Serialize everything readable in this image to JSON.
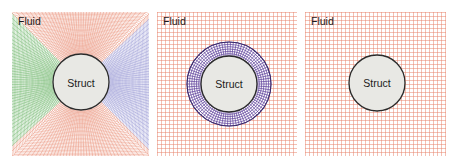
{
  "figure": {
    "panels": [
      {
        "id": "conforming-mesh",
        "region_label": "Fluid",
        "solid_label": "Struct",
        "mesh": "body-fitted radial mesh (green left, red top/bottom, blue right)"
      },
      {
        "id": "overset-mesh",
        "region_label": "Fluid",
        "solid_label": "Struct",
        "mesh": "background Cartesian grid with overset annular mesh (purple)"
      },
      {
        "id": "immersed-boundary",
        "region_label": "Fluid",
        "solid_label": "Struct",
        "mesh": "background Cartesian grid only"
      }
    ],
    "colors": {
      "grid_red": "#e8836a",
      "grid_green": "#5fae5a",
      "grid_blue": "#8a8ad0",
      "ring_purple": "#5b3e9a",
      "struct_fill": "#e8e8e4",
      "struct_outline": "#2a2a2a"
    }
  }
}
